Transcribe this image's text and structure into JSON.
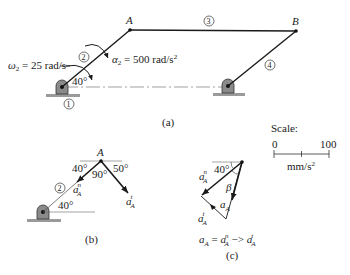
{
  "figure": {
    "panel_a": {
      "caption": "(a)",
      "point_A": "A",
      "point_B": "B",
      "link_labels": [
        "1",
        "2",
        "3",
        "4"
      ],
      "omega_label": "ω",
      "omega_sub": "2",
      "omega_value": " = 25 rad/s",
      "alpha_label": "α",
      "alpha_sub": "2",
      "alpha_value": " = 500 rad/s",
      "alpha_exp": "2",
      "angle": "40°"
    },
    "panel_b": {
      "caption": "(b)",
      "point_A": "A",
      "link_label": "2",
      "angle_left": "40°",
      "angle_right": "50°",
      "angle_mid": "90°",
      "angle_base": "40°",
      "an_label": "a",
      "an_sup": "n",
      "an_sub": "A",
      "at_label": "a",
      "at_sup": "t",
      "at_sub": "A"
    },
    "panel_c": {
      "caption": "(c)",
      "angle": "40°",
      "beta": "β",
      "an_label": "a",
      "an_sup": "n",
      "an_sub": "A",
      "at_label": "a",
      "at_sup": "t",
      "at_sub": "A",
      "a_label": "a",
      "a_sub": "A",
      "equation": {
        "lhs": "a",
        "lhs_sub": "A",
        "eq": " = ",
        "t1": "a",
        "t1_sup": "n",
        "t1_sub": "A",
        "op": " −> ",
        "t2": "a",
        "t2_sup": "t",
        "t2_sub": "A"
      }
    },
    "scale": {
      "title": "Scale:",
      "min": "0",
      "max": "100",
      "unit": "mm/s",
      "unit_exp": "2"
    }
  }
}
